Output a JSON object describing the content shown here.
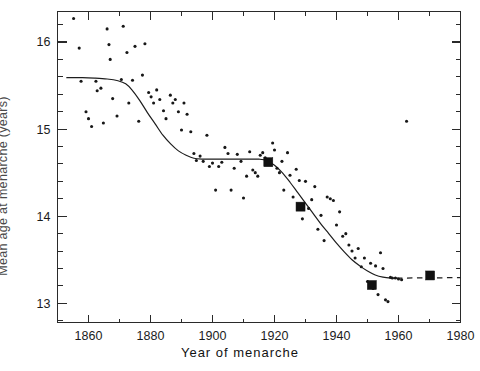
{
  "figure": {
    "background_color": "#ffffff",
    "ink_color": "#1d1d1d"
  },
  "chart_data": {
    "type": "scatter",
    "title": "",
    "subtitle": "",
    "xlabel": "Year of menarche",
    "ylabel": "Mean age at menarche (years)",
    "xlim": [
      1850,
      1980
    ],
    "ylim": [
      12.78,
      16.35
    ],
    "grid": false,
    "legend_position": "none",
    "x_ticks_major": [
      1860,
      1880,
      1900,
      1920,
      1940,
      1960,
      1980
    ],
    "x_tick_labels": [
      "1860",
      "1880",
      "1900",
      "1920",
      "1940",
      "1960",
      "1980"
    ],
    "x_ticks_minor_step": 10,
    "y_ticks_major": [
      13,
      14,
      15,
      16
    ],
    "y_tick_labels": [
      "13",
      "14",
      "15",
      "16"
    ],
    "y_ticks_minor_step": 0.2,
    "annotations": [],
    "series": [
      {
        "name": "Individual study observations",
        "marker": "circle",
        "marker_size_px": 3.1,
        "color": "#171717",
        "points": [
          [
            1855.2,
            16.27
          ],
          [
            1857.0,
            15.93
          ],
          [
            1857.6,
            15.55
          ],
          [
            1859.2,
            15.2
          ],
          [
            1860.0,
            15.12
          ],
          [
            1861.0,
            15.03
          ],
          [
            1862.4,
            15.55
          ],
          [
            1862.8,
            15.44
          ],
          [
            1864.0,
            15.47
          ],
          [
            1864.8,
            15.07
          ],
          [
            1866.0,
            16.15
          ],
          [
            1866.6,
            15.97
          ],
          [
            1867.0,
            15.8
          ],
          [
            1867.8,
            15.35
          ],
          [
            1869.2,
            15.15
          ],
          [
            1870.6,
            15.57
          ],
          [
            1871.2,
            16.18
          ],
          [
            1872.4,
            15.88
          ],
          [
            1873.0,
            15.3
          ],
          [
            1874.2,
            15.56
          ],
          [
            1875.0,
            15.95
          ],
          [
            1876.2,
            15.09
          ],
          [
            1877.4,
            15.62
          ],
          [
            1878.2,
            15.98
          ],
          [
            1879.4,
            15.42
          ],
          [
            1880.2,
            15.37
          ],
          [
            1881.0,
            15.3
          ],
          [
            1882.0,
            15.45
          ],
          [
            1883.0,
            15.34
          ],
          [
            1884.2,
            15.21
          ],
          [
            1885.0,
            15.12
          ],
          [
            1886.4,
            15.39
          ],
          [
            1887.2,
            15.3
          ],
          [
            1888.0,
            15.34
          ],
          [
            1889.0,
            15.2
          ],
          [
            1890.0,
            14.99
          ],
          [
            1890.8,
            15.3
          ],
          [
            1891.8,
            15.17
          ],
          [
            1893.0,
            14.97
          ],
          [
            1894.0,
            14.72
          ],
          [
            1894.8,
            14.64
          ],
          [
            1896.0,
            14.69
          ],
          [
            1897.0,
            14.63
          ],
          [
            1898.2,
            14.93
          ],
          [
            1899.0,
            14.57
          ],
          [
            1900.0,
            14.61
          ],
          [
            1901.0,
            14.3
          ],
          [
            1902.0,
            14.57
          ],
          [
            1903.0,
            14.62
          ],
          [
            1904.0,
            14.79
          ],
          [
            1905.0,
            14.72
          ],
          [
            1906.0,
            14.3
          ],
          [
            1907.0,
            14.55
          ],
          [
            1908.0,
            14.71
          ],
          [
            1909.2,
            14.63
          ],
          [
            1910.0,
            14.21
          ],
          [
            1911.0,
            14.46
          ],
          [
            1912.0,
            14.74
          ],
          [
            1913.0,
            14.53
          ],
          [
            1913.8,
            14.5
          ],
          [
            1914.6,
            14.46
          ],
          [
            1915.4,
            14.7
          ],
          [
            1916.2,
            14.73
          ],
          [
            1917.0,
            14.67
          ],
          [
            1917.8,
            14.64
          ],
          [
            1918.6,
            14.63
          ],
          [
            1919.4,
            14.84
          ],
          [
            1920.0,
            14.76
          ],
          [
            1920.8,
            14.55
          ],
          [
            1921.6,
            14.5
          ],
          [
            1922.4,
            14.63
          ],
          [
            1923.0,
            14.3
          ],
          [
            1924.2,
            14.73
          ],
          [
            1925.0,
            14.47
          ],
          [
            1926.0,
            14.22
          ],
          [
            1927.0,
            14.54
          ],
          [
            1928.0,
            14.41
          ],
          [
            1929.0,
            13.97
          ],
          [
            1930.0,
            14.4
          ],
          [
            1931.0,
            14.09
          ],
          [
            1932.0,
            14.19
          ],
          [
            1933.0,
            14.34
          ],
          [
            1934.0,
            13.85
          ],
          [
            1935.0,
            14.01
          ],
          [
            1936.0,
            13.72
          ],
          [
            1937.0,
            14.22
          ],
          [
            1938.0,
            14.2
          ],
          [
            1939.0,
            14.18
          ],
          [
            1940.0,
            13.9
          ],
          [
            1941.0,
            14.05
          ],
          [
            1942.0,
            13.77
          ],
          [
            1943.0,
            13.8
          ],
          [
            1944.0,
            13.67
          ],
          [
            1945.0,
            13.6
          ],
          [
            1946.0,
            13.52
          ],
          [
            1947.0,
            13.63
          ],
          [
            1948.0,
            13.42
          ],
          [
            1949.0,
            13.52
          ],
          [
            1950.0,
            13.25
          ],
          [
            1951.0,
            13.46
          ],
          [
            1951.8,
            13.17
          ],
          [
            1952.6,
            13.43
          ],
          [
            1953.4,
            13.1
          ],
          [
            1954.2,
            13.58
          ],
          [
            1955.0,
            13.4
          ],
          [
            1955.8,
            13.04
          ],
          [
            1956.6,
            13.02
          ],
          [
            1957.4,
            13.3
          ],
          [
            1958.0,
            13.29
          ],
          [
            1959.0,
            13.29
          ],
          [
            1960.0,
            13.28
          ],
          [
            1961.0,
            13.27
          ],
          [
            1962.6,
            15.09
          ]
        ]
      },
      {
        "name": "Large national survey estimates",
        "marker": "square",
        "marker_size_px": 9.0,
        "color": "#111111",
        "points": [
          [
            1918.0,
            14.62
          ],
          [
            1928.4,
            14.11
          ],
          [
            1951.4,
            13.21
          ],
          [
            1970.2,
            13.32
          ]
        ]
      }
    ],
    "fit_curve": {
      "name": "Smoothed trend",
      "style": "solid-with-dashed-extension",
      "color": "#1d1d1d",
      "solid_points": [
        [
          1853.0,
          15.59
        ],
        [
          1858.0,
          15.59
        ],
        [
          1862.0,
          15.585
        ],
        [
          1866.0,
          15.575
        ],
        [
          1869.5,
          15.555
        ],
        [
          1872.0,
          15.52
        ],
        [
          1874.0,
          15.45
        ],
        [
          1876.5,
          15.33
        ],
        [
          1879.0,
          15.19
        ],
        [
          1881.5,
          15.06
        ],
        [
          1884.0,
          14.93
        ],
        [
          1886.5,
          14.83
        ],
        [
          1889.0,
          14.75
        ],
        [
          1891.5,
          14.7
        ],
        [
          1894.0,
          14.665
        ],
        [
          1897.0,
          14.655
        ],
        [
          1900.0,
          14.655
        ],
        [
          1903.0,
          14.655
        ],
        [
          1906.0,
          14.655
        ],
        [
          1909.0,
          14.655
        ],
        [
          1912.0,
          14.655
        ],
        [
          1915.0,
          14.655
        ],
        [
          1917.5,
          14.64
        ],
        [
          1920.0,
          14.585
        ],
        [
          1922.5,
          14.5
        ],
        [
          1925.0,
          14.39
        ],
        [
          1927.5,
          14.27
        ],
        [
          1930.0,
          14.15
        ],
        [
          1932.5,
          14.03
        ],
        [
          1935.0,
          13.91
        ],
        [
          1937.5,
          13.8
        ],
        [
          1940.0,
          13.69
        ],
        [
          1942.5,
          13.59
        ],
        [
          1945.0,
          13.5
        ],
        [
          1947.5,
          13.43
        ],
        [
          1950.0,
          13.37
        ],
        [
          1952.5,
          13.325
        ],
        [
          1955.0,
          13.3
        ],
        [
          1957.5,
          13.29
        ],
        [
          1959.5,
          13.29
        ]
      ],
      "dashed_points": [
        [
          1959.5,
          13.29
        ],
        [
          1980.0,
          13.295
        ]
      ]
    }
  }
}
